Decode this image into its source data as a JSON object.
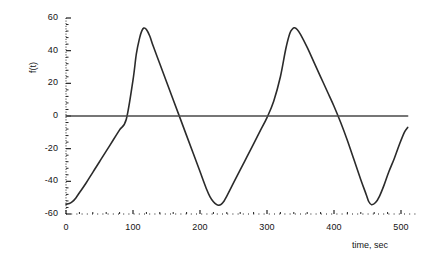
{
  "chart_data": {
    "type": "line",
    "title": "",
    "subtitle": "",
    "xlabel": "time, sec",
    "ylabel": "f(t)",
    "xlim": [
      0,
      510
    ],
    "ylim": [
      -60,
      60
    ],
    "xticks": [
      0,
      100,
      200,
      300,
      400,
      500
    ],
    "xtick_labels": [
      "0",
      "100",
      "200",
      "300",
      "400",
      "500"
    ],
    "yticks": [
      -60,
      -40,
      -20,
      0,
      20,
      40,
      60
    ],
    "ytick_labels": [
      "-60",
      "-40",
      "-20",
      "0",
      "20",
      "40",
      "60"
    ],
    "grid": false,
    "legend": null,
    "annotations": [],
    "series": [
      {
        "name": "f(t)",
        "description": "rounded triangle wave, amplitude 54, period 225 sec, starting near minimum at t=0",
        "color": "#2b2b2b",
        "linewidth": 1.6,
        "x": [
          0,
          5,
          10,
          15,
          20,
          30,
          40,
          50,
          60,
          70,
          80,
          90,
          100,
          105,
          110,
          113,
          116,
          120,
          125,
          130,
          140,
          150,
          160,
          170,
          180,
          190,
          200,
          210,
          215,
          220,
          225,
          228,
          231,
          236,
          240,
          250,
          260,
          270,
          280,
          290,
          300,
          310,
          320,
          328,
          334,
          338,
          341,
          345,
          350,
          360,
          370,
          380,
          390,
          400,
          410,
          420,
          430,
          440,
          448,
          452,
          456,
          462,
          468,
          475,
          482,
          490,
          498,
          505,
          510
        ],
        "y": [
          -54.0,
          -53.6,
          -52.3,
          -50.0,
          -47.0,
          -41.0,
          -34.5,
          -28.0,
          -21.5,
          -15.0,
          -8.5,
          -2.0,
          22.0,
          38.0,
          48.0,
          52.0,
          53.8,
          53.0,
          49.0,
          43.0,
          32.0,
          21.0,
          10.0,
          -1.0,
          -12.0,
          -23.0,
          -34.0,
          -45.0,
          -49.5,
          -52.5,
          -54.3,
          -54.6,
          -54.2,
          -52.0,
          -49.0,
          -41.0,
          -33.0,
          -25.0,
          -17.0,
          -9.0,
          -1.0,
          9.0,
          24.0,
          41.0,
          50.5,
          53.3,
          54.0,
          53.0,
          50.0,
          42.0,
          33.0,
          24.0,
          15.0,
          6.0,
          -4.0,
          -15.0,
          -27.0,
          -39.0,
          -48.0,
          -52.5,
          -54.3,
          -53.0,
          -49.0,
          -42.0,
          -34.0,
          -26.0,
          -17.0,
          -10.0,
          -7.0
        ]
      },
      {
        "name": "zero-line",
        "description": "horizontal reference line at f(t) = 0",
        "color": "#4a4a4a",
        "linewidth": 1.5,
        "x": [
          0,
          510
        ],
        "y": [
          0,
          0
        ]
      }
    ]
  },
  "axes": {
    "y_axis_style": "dotted",
    "x_axis_style": "dotted",
    "tick_color": "#222222"
  }
}
